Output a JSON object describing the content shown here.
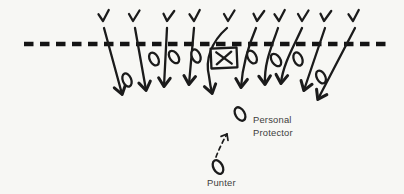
{
  "diagram": {
    "type": "football-play-diagram",
    "background_color": "#f7f7f4",
    "ink_color": "#1b1b1b",
    "label_color": "#3d3d3d",
    "scrimmage_line": {
      "x1": 24,
      "x2": 392,
      "y": 44
    },
    "defense": {
      "symbol": "V",
      "players": [
        {
          "x": 103,
          "y": 21
        },
        {
          "x": 133,
          "y": 21
        },
        {
          "x": 167,
          "y": 21
        },
        {
          "x": 194,
          "y": 21
        },
        {
          "x": 228,
          "y": 21
        },
        {
          "x": 257,
          "y": 21
        },
        {
          "x": 279,
          "y": 21
        },
        {
          "x": 302,
          "y": 21
        },
        {
          "x": 324,
          "y": 21
        },
        {
          "x": 353,
          "y": 21
        }
      ],
      "rush_paths": [
        "M104,28 L122,94",
        "M135,28 L146,90",
        "M167,28 L164,86",
        "M194,28 L189,84",
        "M227,28 C211,42 205,60 209,76 C210,84 211,89 212,93",
        "M256,28 C250,42 243,60 241,87",
        "M278,28 C272,46 264,62 265,84",
        "M302,28 C294,46 283,64 281,83",
        "M325,28 L304,90",
        "M355,28 L318,99"
      ]
    },
    "offense": {
      "symbol": "O",
      "linemen": [
        {
          "x": 127,
          "y": 80
        },
        {
          "x": 154,
          "y": 59
        },
        {
          "x": 174,
          "y": 57
        },
        {
          "x": 196,
          "y": 56
        },
        {
          "x": 252,
          "y": 57
        },
        {
          "x": 276,
          "y": 60
        },
        {
          "x": 298,
          "y": 59
        },
        {
          "x": 321,
          "y": 77
        }
      ],
      "center": {
        "symbol": "X",
        "x": 224,
        "y": 58,
        "box_width": 26,
        "box_height": 20
      },
      "personal_protector": {
        "x": 240,
        "y": 114,
        "label_lines": [
          "Personal",
          "Protector"
        ]
      },
      "punter": {
        "x": 218,
        "y": 167,
        "label": "Punter",
        "motion_path": "M216,157 C219,149 223,141 227,134"
      }
    }
  }
}
